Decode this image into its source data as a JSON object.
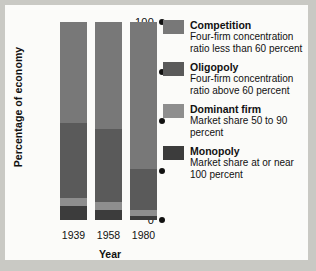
{
  "chart_data": {
    "type": "bar",
    "stacked": true,
    "title": "",
    "xlabel": "Year",
    "ylabel": "Percentage of economy",
    "categories": [
      "1939",
      "1958",
      "1980"
    ],
    "ylim": [
      0,
      100
    ],
    "yticks": [
      100,
      75,
      50,
      25,
      0
    ],
    "grid": false,
    "legend_position": "right",
    "series": [
      {
        "name": "Competition",
        "description": "Four-firm concentration ratio less than 60 percent",
        "color": "#787878",
        "values": [
          51,
          54,
          74
        ]
      },
      {
        "name": "Oligopoly",
        "description": "Four-firm concentration ratio above 60 percent",
        "color": "#5a5a5a",
        "values": [
          38,
          37,
          21
        ]
      },
      {
        "name": "Dominant firm",
        "description": "Market share 50 to 90 percent",
        "color": "#8e8e8e",
        "values": [
          4,
          4,
          3
        ]
      },
      {
        "name": "Monopoly",
        "description": "Market share at or near 100 percent",
        "color": "#3c3c3c",
        "values": [
          7,
          5,
          2
        ]
      }
    ]
  },
  "axes": {
    "y_title": "Percentage of economy",
    "x_title": "Year",
    "y_ticks": [
      "100",
      "75",
      "50",
      "25",
      "0"
    ],
    "x_ticks": [
      "1939",
      "1958",
      "1980"
    ]
  },
  "legend": {
    "items": [
      {
        "label": "Competition",
        "description": "Four-firm concentration ratio less than 60 percent",
        "color": "#787878"
      },
      {
        "label": "Oligopoly",
        "description": "Four-firm concentration ratio above 60 percent",
        "color": "#5a5a5a"
      },
      {
        "label": "Dominant firm",
        "description": "Market share 50 to 90 percent",
        "color": "#8e8e8e"
      },
      {
        "label": "Monopoly",
        "description": "Market share at or near 100 percent",
        "color": "#3c3c3c"
      }
    ]
  }
}
